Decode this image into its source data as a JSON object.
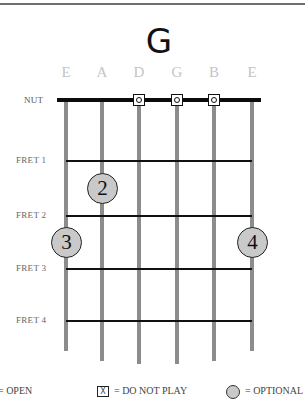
{
  "chord": {
    "name": "G"
  },
  "strings": [
    {
      "label": "E",
      "x": 66,
      "bottom": 351
    },
    {
      "label": "A",
      "x": 102,
      "bottom": 361
    },
    {
      "label": "D",
      "x": 139,
      "bottom": 364
    },
    {
      "label": "G",
      "x": 177,
      "bottom": 364
    },
    {
      "label": "B",
      "x": 214,
      "bottom": 361
    },
    {
      "label": "E",
      "x": 252,
      "bottom": 351
    }
  ],
  "nut_label": "NUT",
  "frets": [
    {
      "label": "FRET 1",
      "y": 160
    },
    {
      "label": "FRET 2",
      "y": 215
    },
    {
      "label": "FRET 3",
      "y": 268
    },
    {
      "label": "FRET 4",
      "y": 320
    }
  ],
  "open_strings": [
    "D",
    "G",
    "B"
  ],
  "fingers": [
    {
      "finger": "2",
      "string": "A",
      "fret": 1.5
    },
    {
      "finger": "3",
      "string": "E (low)",
      "fret": 2.5
    },
    {
      "finger": "4",
      "string": "E (high)",
      "fret": 2.5
    }
  ],
  "legend": {
    "open": "= OPEN",
    "do_not_play_symbol": "X",
    "do_not_play": "= DO NOT PLAY",
    "optional": "= OPTIONAL"
  },
  "colors": {
    "string": "#8c8c8c",
    "nut": "#0c0c0c",
    "finger_fill": "#c9c9c9",
    "string_label": "#c4c4c4"
  }
}
